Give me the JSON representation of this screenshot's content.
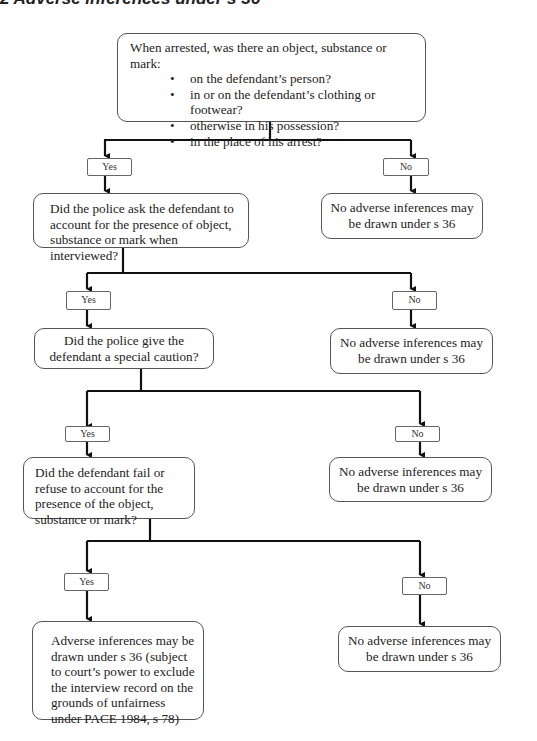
{
  "title": "2  Adverse inferences under s 36",
  "nodes": {
    "q1": {
      "intro": "When arrested, was there an object, substance or mark:",
      "bullets": [
        "on the defendant’s person?",
        "in or on the defendant’s clothing or footwear?",
        "otherwise in his possession?",
        "in the place of his arrest?"
      ]
    },
    "q2": {
      "text": "Did the police ask the defendant to account for the presence of object, substance or mark when interviewed?"
    },
    "q3": {
      "text": "Did the police give the defendant a special caution?"
    },
    "q4": {
      "text": "Did the defendant fail or refuse to account for the presence of the object, substance or mark?"
    },
    "outcome_yes": {
      "text": "Adverse inferences may be drawn under s 36 (subject to court’s power to exclude the interview record on the grounds of unfairness under PACE 1984, s 78)"
    },
    "no_outcome_1": {
      "text": "No adverse inferences may be drawn under s 36"
    },
    "no_outcome_2": {
      "text": "No adverse inferences may be drawn under s 36"
    },
    "no_outcome_3": {
      "text": "No adverse inferences may be drawn under s 36"
    },
    "no_outcome_4": {
      "text": "No adverse inferences may be drawn under s 36"
    }
  },
  "labels": {
    "yes": "Yes",
    "no": "No"
  },
  "colors": {
    "line": "#111111",
    "box_border": "#555555",
    "text": "#222222"
  }
}
